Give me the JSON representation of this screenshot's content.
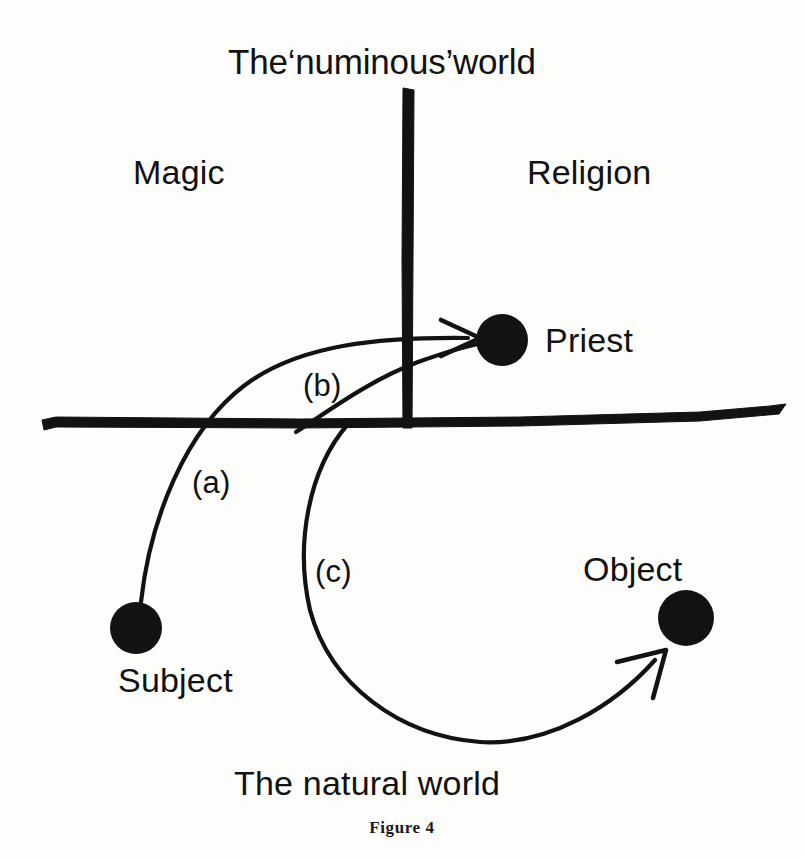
{
  "figure": {
    "caption": "Figure 4",
    "title": "The‘numinous’world",
    "bottom_label": "The natural world",
    "ink_color": "#121212",
    "background_color": "#fdfdfb"
  },
  "quadrants": {
    "left_label": "Magic",
    "right_label": "Religion"
  },
  "nodes": [
    {
      "id": "priest",
      "label": "Priest",
      "cx": 502,
      "cy": 340,
      "r": 26,
      "label_x": 545,
      "label_y": 323
    },
    {
      "id": "subject",
      "label": "Subject",
      "cx": 136,
      "cy": 628,
      "r": 26,
      "label_x": 118,
      "label_y": 663
    },
    {
      "id": "object",
      "label": "Object",
      "cx": 686,
      "cy": 618,
      "r": 28,
      "label_x": 583,
      "label_y": 552
    }
  ],
  "edges": [
    {
      "id": "a",
      "label": "(a)",
      "label_x": 192,
      "label_y": 467,
      "from": "subject",
      "to": "priest"
    },
    {
      "id": "b",
      "label": "(b)",
      "label_x": 303,
      "label_y": 370,
      "from": "below",
      "to": "priest"
    },
    {
      "id": "c",
      "label": "(c)",
      "label_x": 315,
      "label_y": 556,
      "from": "priest",
      "to": "object"
    }
  ],
  "axes": {
    "vertical_name": "numinous-axis",
    "horizontal_name": "world-boundary-axis"
  }
}
